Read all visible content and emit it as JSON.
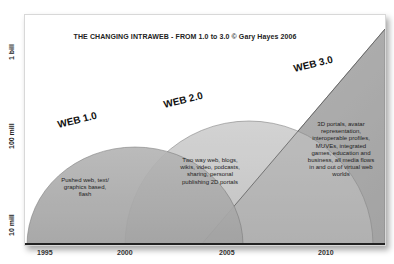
{
  "title": "THE CHANGING INTRAWEB - FROM 1.0 to 3.0 © Gary Hayes 2006",
  "y_axis": {
    "labels": [
      "1 bill",
      "100 mill",
      "10 mill"
    ]
  },
  "x_axis": {
    "labels": [
      "1995",
      "2000",
      "2005",
      "2010"
    ]
  },
  "eras": [
    {
      "name": "WEB 1.0",
      "description": "Pushed web, text/ graphics based, flash",
      "color": "#a8a8a8"
    },
    {
      "name": "WEB 2.0",
      "description": "Two way web, blogs, wikis, video, podcasts, sharing, personal publishing 2D portals",
      "color": "#c4c4c4"
    },
    {
      "name": "WEB 3.0",
      "description": "3D portals, avatar representation, interoperable profiles, MUVEs, integrated games, education and business, all media flows in and out of virtual web worlds",
      "color": "#b4b4b4"
    }
  ],
  "colors": {
    "panel_bg": "#ffffff",
    "web1_fill": "#a8a8a8",
    "web2_fill": "#c6c6c6",
    "web3_fill": "#b2b2b2",
    "overlap_fill": "#9a9a9a",
    "edge": "#555555"
  }
}
